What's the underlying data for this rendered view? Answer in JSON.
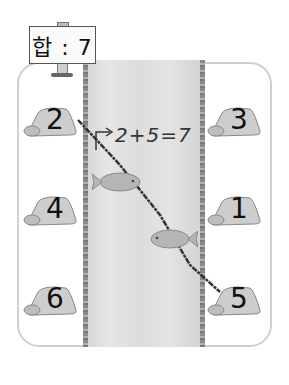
{
  "sign": {
    "text": "합 : 7",
    "sum_label": "합",
    "sum_value": "7"
  },
  "equation": {
    "text": "2+5=7"
  },
  "stones": [
    {
      "value": "2",
      "side": "left",
      "row": 1,
      "selected": true
    },
    {
      "value": "3",
      "side": "right",
      "row": 1,
      "selected": false
    },
    {
      "value": "4",
      "side": "left",
      "row": 2,
      "selected": false
    },
    {
      "value": "1",
      "side": "right",
      "row": 2,
      "selected": false
    },
    {
      "value": "6",
      "side": "left",
      "row": 3,
      "selected": false
    },
    {
      "value": "5",
      "side": "right",
      "row": 3,
      "selected": true
    }
  ],
  "connection": {
    "from": "2",
    "to": "5"
  },
  "fish": [
    {
      "name": "fish-upper"
    },
    {
      "name": "fish-lower"
    }
  ],
  "colors": {
    "frame": "#cfcfcf",
    "river": "#dcdcdc",
    "bank": "#8a8a8a",
    "line": "#333333",
    "stone": "#c8c8c8"
  }
}
